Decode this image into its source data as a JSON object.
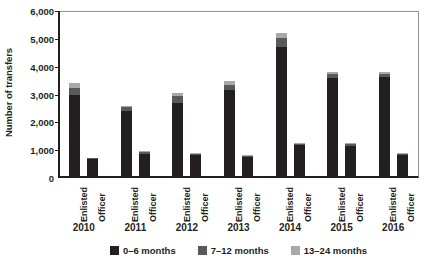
{
  "chart_data": {
    "type": "bar",
    "stacked": true,
    "title": "",
    "xlabel": "",
    "ylabel": "Number of transfers",
    "ylim": [
      0,
      6000
    ],
    "ytick_values": [
      0,
      1000,
      2000,
      3000,
      4000,
      5000,
      6000
    ],
    "ytick_labels": [
      "0",
      "1,000",
      "2,000",
      "3,000",
      "4,000",
      "5,000",
      "6,000"
    ],
    "grid": false,
    "legend_position": "bottom",
    "groups": [
      "2010",
      "2011",
      "2012",
      "2013",
      "2014",
      "2015",
      "2016"
    ],
    "categories": [
      "Enlisted",
      "Officer",
      "Enlisted",
      "Officer",
      "Enlisted",
      "Officer",
      "Enlisted",
      "Officer",
      "Enlisted",
      "Officer",
      "Enlisted",
      "Officer",
      "Enlisted",
      "Officer"
    ],
    "series": [
      {
        "name": "0–6 months",
        "color": "#231f20",
        "values": [
          3000,
          700,
          2400,
          880,
          2700,
          830,
          3150,
          760,
          4700,
          1180,
          3600,
          1160,
          3620,
          830
        ]
      },
      {
        "name": "7–12 months",
        "color": "#58595b",
        "values": [
          250,
          20,
          140,
          50,
          230,
          50,
          200,
          40,
          330,
          60,
          140,
          60,
          130,
          50
        ]
      },
      {
        "name": "13–24 months",
        "color": "#a7a9ac",
        "values": [
          150,
          10,
          60,
          30,
          120,
          30,
          120,
          20,
          180,
          30,
          70,
          30,
          60,
          30
        ]
      }
    ],
    "totals": [
      3400,
      730,
      2600,
      960,
      3050,
      910,
      3470,
      820,
      5210,
      1270,
      3810,
      1250,
      3810,
      910
    ]
  },
  "legend": {
    "items": [
      {
        "label": "0–6 months",
        "color": "#231f20"
      },
      {
        "label": "7–12 months",
        "color": "#58595b"
      },
      {
        "label": "13–24 months",
        "color": "#a7a9ac"
      }
    ]
  },
  "axis": {
    "y_title": "Number of transfers"
  }
}
